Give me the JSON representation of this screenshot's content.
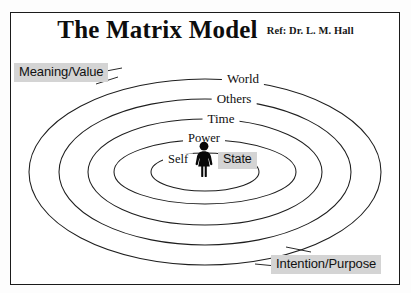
{
  "document": {
    "title": "The Matrix Model",
    "reference": "Ref: Dr. L. M. Hall"
  },
  "diagram": {
    "type": "concentric-ellipse-model",
    "center_figure_icon": "person-figure-icon",
    "rings": [
      {
        "label": "World",
        "index": 1,
        "position": "outermost"
      },
      {
        "label": "Others",
        "index": 2,
        "position": "outer"
      },
      {
        "label": "Time",
        "index": 3,
        "position": "middle"
      },
      {
        "label": "Power",
        "index": 4,
        "position": "inner"
      },
      {
        "label": "Self",
        "index": 5,
        "position": "innermost"
      }
    ],
    "highlighted_labels": [
      {
        "text": "Meaning/Value",
        "corner": "top-left"
      },
      {
        "text": "Intention/Purpose",
        "corner": "bottom-right"
      },
      {
        "text": "State",
        "corner": "center"
      }
    ],
    "colors": {
      "highlight_background": "#d4d4d4",
      "stroke": "#1e1e1e",
      "text": "#0f0f0f",
      "page_background": "#ffffff"
    }
  }
}
